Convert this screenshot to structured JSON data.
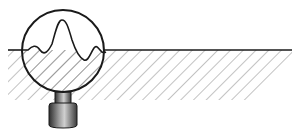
{
  "diagram": {
    "elements": [
      {
        "name": "surface-line",
        "label": "Surface"
      },
      {
        "name": "hatched-material",
        "label": "Material (hatched)"
      },
      {
        "name": "magnifying-glass",
        "label": "Magnifying lens"
      },
      {
        "name": "roughness-profile",
        "label": "Magnified surface roughness"
      }
    ],
    "colors": {
      "stroke": "#1a1a1a",
      "hatch": "#7a7a7a",
      "background": "#ffffff",
      "handle_dark": "#3a3a3a",
      "handle_light": "#c8c8c8"
    }
  }
}
